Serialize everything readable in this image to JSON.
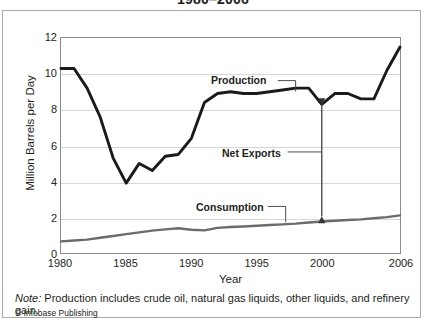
{
  "chart_data": {
    "type": "line",
    "title": "1980–2006",
    "xlabel": "Year",
    "ylabel": "Million Barrels per Day",
    "xlim": [
      1980,
      2006
    ],
    "ylim": [
      0,
      12
    ],
    "yticks": [
      0,
      2,
      4,
      6,
      8,
      10,
      12
    ],
    "xticks": [
      1980,
      1985,
      1990,
      1995,
      2000,
      2006
    ],
    "grid": "horizontal",
    "legend": "none",
    "x": [
      1980,
      1981,
      1982,
      1983,
      1984,
      1985,
      1986,
      1987,
      1988,
      1989,
      1990,
      1991,
      1992,
      1993,
      1994,
      1995,
      1996,
      1997,
      1998,
      1999,
      2000,
      2001,
      2002,
      2003,
      2004,
      2005,
      2006
    ],
    "series": [
      {
        "name": "Production",
        "color": "#1a1a1a",
        "values": [
          10.3,
          10.3,
          9.2,
          7.6,
          5.3,
          3.9,
          5.0,
          4.6,
          5.4,
          5.5,
          6.4,
          8.4,
          8.9,
          9.0,
          8.9,
          8.9,
          9.0,
          9.1,
          9.2,
          9.2,
          8.3,
          8.9,
          8.9,
          8.6,
          8.6,
          10.2,
          11.0
        ],
        "endpoint_value": 11.5
      },
      {
        "name": "Consumption",
        "color": "#6b6b6b",
        "values": [
          0.65,
          0.7,
          0.75,
          0.85,
          0.95,
          1.05,
          1.15,
          1.25,
          1.32,
          1.38,
          1.3,
          1.26,
          1.4,
          1.45,
          1.48,
          1.52,
          1.56,
          1.6,
          1.64,
          1.7,
          1.76,
          1.8,
          1.84,
          1.88,
          1.94,
          2.0,
          2.1
        ]
      }
    ],
    "annotations": [
      {
        "name": "production-label",
        "text": "Production",
        "points_to_year": 1998,
        "points_to_value": 9.2
      },
      {
        "name": "net-exports-label",
        "text": "Net Exports",
        "points_to_year": 2000,
        "points_to_value": 5.2
      },
      {
        "name": "consumption-label",
        "text": "Consumption",
        "points_to_year": 1998,
        "points_to_value": 1.64
      },
      {
        "name": "net-exports-arrow",
        "text": "",
        "year": 2000,
        "from_value": 2.05,
        "to_value": 8.25
      }
    ]
  },
  "note": {
    "label": "Note:",
    "text": " Production includes crude oil, natural gas liquids, other liquids, and refinery gain."
  },
  "credit": "© Infobase Publishing"
}
